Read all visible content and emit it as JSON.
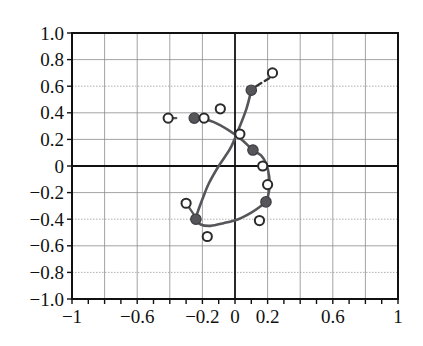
{
  "chart_data": {
    "type": "scatter",
    "title": "",
    "xlabel": "",
    "ylabel": "",
    "xlim": [
      -1,
      1
    ],
    "ylim": [
      -1,
      1
    ],
    "grid": true,
    "legend": "none",
    "xticks": [
      -1,
      -0.6,
      -0.2,
      0,
      0.2,
      0.6,
      1
    ],
    "xticklabels": [
      "-1",
      "-0.6",
      "-0.2",
      "0",
      "0.2",
      "0.6",
      "1"
    ],
    "yticks": [
      1.0,
      0.8,
      0.6,
      0.4,
      0.2,
      0,
      -0.2,
      -0.4,
      -0.6,
      -0.8,
      -1.0
    ],
    "yticklabels": [
      "1.0",
      "0.8",
      "0.6",
      "0.4",
      "0.2",
      "0",
      "-0.2",
      "-0.4",
      "-0.6",
      "-0.8",
      "-1.0"
    ],
    "minor_grid_step": 0.2,
    "series": [
      {
        "name": "filled-markers",
        "marker": "filled-circle",
        "color": "#55555a",
        "points": [
          [
            0.1,
            0.57
          ],
          [
            -0.25,
            0.36
          ],
          [
            0.11,
            0.12
          ],
          [
            0.19,
            -0.27
          ],
          [
            -0.24,
            -0.4
          ]
        ]
      },
      {
        "name": "open-markers",
        "marker": "open-circle",
        "color": "#2b2b2b",
        "points": [
          [
            0.23,
            0.7
          ],
          [
            -0.09,
            0.43
          ],
          [
            -0.41,
            0.36
          ],
          [
            -0.19,
            0.36
          ],
          [
            0.03,
            0.24
          ],
          [
            0.17,
            0.0
          ],
          [
            0.2,
            -0.14
          ],
          [
            -0.3,
            -0.28
          ],
          [
            0.15,
            -0.41
          ],
          [
            -0.17,
            -0.53
          ]
        ]
      }
    ],
    "solid_curve": {
      "name": "locus-curve",
      "color": "#55555a",
      "points": [
        [
          0.1,
          0.57
        ],
        [
          0.07,
          0.43
        ],
        [
          0.02,
          0.27
        ],
        [
          -0.03,
          0.13
        ],
        [
          -0.1,
          0.0
        ],
        [
          -0.16,
          -0.13
        ],
        [
          -0.2,
          -0.25
        ],
        [
          -0.23,
          -0.35
        ],
        [
          -0.24,
          -0.4
        ],
        [
          -0.21,
          -0.44
        ],
        [
          -0.15,
          -0.45
        ],
        [
          -0.07,
          -0.43
        ],
        [
          0.02,
          -0.4
        ],
        [
          0.1,
          -0.35
        ],
        [
          0.16,
          -0.3
        ],
        [
          0.19,
          -0.27
        ],
        [
          0.21,
          -0.18
        ],
        [
          0.21,
          -0.08
        ],
        [
          0.19,
          0.02
        ],
        [
          0.16,
          0.08
        ],
        [
          0.11,
          0.12
        ],
        [
          0.04,
          0.2
        ],
        [
          -0.04,
          0.27
        ],
        [
          -0.13,
          0.33
        ],
        [
          -0.21,
          0.36
        ],
        [
          -0.25,
          0.36
        ]
      ]
    },
    "dashed_segment": {
      "name": "dashed-tail",
      "color": "#333333",
      "from": [
        0.13,
        0.6
      ],
      "to": [
        0.21,
        0.66
      ]
    },
    "connector_segments": [
      {
        "from": [
          -0.41,
          0.36
        ],
        "to": [
          -0.36,
          0.36
        ]
      },
      {
        "from": [
          -0.3,
          -0.28
        ],
        "to": [
          -0.25,
          -0.37
        ]
      }
    ]
  }
}
